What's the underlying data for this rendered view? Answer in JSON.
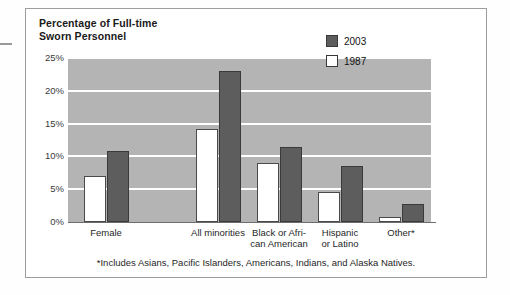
{
  "card": {
    "title": "Percentage of Full-time\nSworn Personnel",
    "footnote": "*Includes Asians, Pacific Islanders, Americans, Indians, and Alaska Natives."
  },
  "legend": {
    "items": [
      {
        "label": "2003",
        "swatch": "dark-gray",
        "color": "#5d5d5d"
      },
      {
        "label": "1987",
        "swatch": "white",
        "color": "#ffffff"
      }
    ]
  },
  "axis": {
    "y_ticks": [
      "25%",
      "20%",
      "15%",
      "10%",
      "5%",
      "0%"
    ],
    "x_labels": [
      "Female",
      "All minorities",
      "Black or Afri-\ncan American",
      "Hispanic\nor Latino",
      "Other*"
    ]
  },
  "chart_data": {
    "type": "bar",
    "title": "Percentage of Full-time Sworn Personnel",
    "xlabel": "",
    "ylabel": "Percentage of Full-time Sworn Personnel",
    "ylim": [
      0,
      25
    ],
    "ytick_values": [
      0,
      5,
      10,
      15,
      20,
      25
    ],
    "ytick_labels": [
      "0%",
      "5%",
      "10%",
      "15%",
      "20%",
      "25%"
    ],
    "grid": true,
    "grid_axis": "y",
    "legend_position": "inside-top-right",
    "categories": [
      "Female",
      "All minorities",
      "Black or African American",
      "Hispanic or Latino",
      "Other*"
    ],
    "series": [
      {
        "name": "1987",
        "color": "#ffffff",
        "values": [
          7.0,
          14.2,
          9.0,
          4.5,
          0.8
        ]
      },
      {
        "name": "2003",
        "color": "#5d5d5d",
        "values": [
          10.8,
          23.0,
          11.5,
          8.5,
          2.8
        ]
      }
    ],
    "annotations": [
      "*Includes Asians, Pacific Islanders, Americans, Indians, and Alaska Natives."
    ]
  }
}
